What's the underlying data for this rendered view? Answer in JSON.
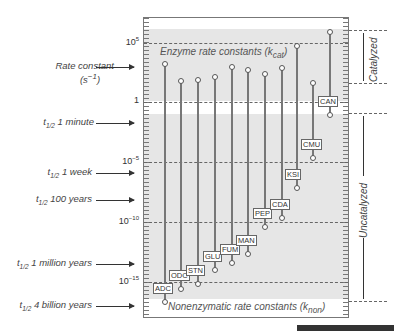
{
  "chart_data": {
    "type": "bar",
    "subtype": "range-dumbbell (log scale)",
    "title": "",
    "ylabel": "Rate constant (s^-1)",
    "yscale": "log10",
    "ylim": [
      -17.5,
      7
    ],
    "y_ticks": [
      {
        "label": "10",
        "exp": "5",
        "value": 5
      },
      {
        "label": "1",
        "exp": "",
        "value": 0
      },
      {
        "label": "10",
        "exp": "−5",
        "value": -5
      },
      {
        "label": "10",
        "exp": "−10",
        "value": -10
      },
      {
        "label": "10",
        "exp": "−15",
        "value": -15
      }
    ],
    "categories": [
      "ADC",
      "ODC",
      "STN",
      "GLU",
      "FUM",
      "MAN",
      "PEP",
      "CDA",
      "KSI",
      "CMU",
      "CAN"
    ],
    "series": [
      {
        "name": "Enzyme rate constants (kcat), log10 s^-1",
        "values": [
          3.2,
          1.75,
          1.8,
          2.1,
          2.9,
          2.7,
          2.3,
          2.8,
          4.7,
          1.6,
          5.8
        ]
      },
      {
        "name": "Nonenzymatic rate constants (knon), log10 s^-1",
        "values": [
          -16.7,
          -15.6,
          -15.2,
          -14.0,
          -13.4,
          -12.7,
          -10.4,
          -9.7,
          -7.2,
          -4.7,
          -1.1
        ]
      }
    ],
    "band_labels": {
      "top": "Enzyme rate constants (k",
      "top_sub": "cat",
      "bottom": "Nonenzymatic rate constants (k",
      "bottom_sub": "non"
    },
    "left_annotations": [
      {
        "text": "Rate constant",
        "sub": "",
        "suffix": "",
        "line2": "(s",
        "line2_exp": "−1",
        "line2_end": ")",
        "value": 3
      },
      {
        "text": "t",
        "sub": "1/2",
        "suffix": " 1 minute",
        "value": -1.8
      },
      {
        "text": "t",
        "sub": "1/2",
        "suffix": " 1 week",
        "value": -6.0
      },
      {
        "text": "t",
        "sub": "1/2",
        "suffix": " 100 years",
        "value": -8.6
      },
      {
        "text": "t",
        "sub": "1/2",
        "suffix": " 1 million years",
        "value": -13.5
      },
      {
        "text": "t",
        "sub": "1/2",
        "suffix": " 4 billion years",
        "value": -17.2
      }
    ],
    "right_annotations": [
      {
        "text": "Catalyzed",
        "range": [
          1.5,
          5.8
        ]
      },
      {
        "text": "Uncatalyzed",
        "range": [
          -17.0,
          -1.1
        ]
      }
    ],
    "grid": "dashed lines at 10^5, 1, 10^-5, 10^-10, 10^-15",
    "legend": "none"
  }
}
